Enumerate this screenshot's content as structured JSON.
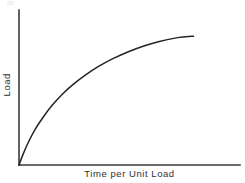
{
  "figure": {
    "width": 245,
    "height": 183,
    "background_color": "#ffffff",
    "axis_color": "#3a3a3c",
    "curve_color": "#242426",
    "text_color": "#303032"
  },
  "axes": {
    "x_title": "Time per Unit Load",
    "y_title": "Load",
    "origin_px": [
      19,
      165
    ],
    "x_axis_end_px": [
      240,
      165
    ],
    "y_axis_top_px": [
      19,
      10
    ]
  },
  "chart_data": {
    "type": "line",
    "title": "",
    "subtitle": "",
    "xlabel": "Time per Unit Load",
    "ylabel": "Load",
    "xlim": [
      0,
      1
    ],
    "ylim": [
      0,
      1
    ],
    "grid": false,
    "legend": null,
    "tick_labels": {
      "x": [],
      "y": []
    },
    "annotations": [],
    "series": [
      {
        "name": "Load curve",
        "x": [
          0.0,
          0.02,
          0.045,
          0.075,
          0.11,
          0.15,
          0.195,
          0.245,
          0.3,
          0.36,
          0.425,
          0.495,
          0.565,
          0.635,
          0.7,
          0.745,
          0.77,
          0.785,
          0.79
        ],
        "y": [
          0.0,
          0.075,
          0.155,
          0.235,
          0.31,
          0.385,
          0.455,
          0.52,
          0.58,
          0.636,
          0.686,
          0.731,
          0.768,
          0.797,
          0.817,
          0.826,
          0.829,
          0.83,
          0.83
        ]
      }
    ]
  }
}
